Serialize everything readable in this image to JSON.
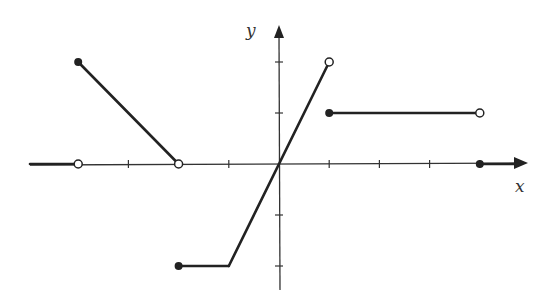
{
  "chart_data": {
    "type": "line",
    "title": "",
    "xlabel": "x",
    "ylabel": "y",
    "xlim": [
      -5,
      5
    ],
    "ylim": [
      -2,
      2
    ],
    "grid": false,
    "tick_labels_shown": false,
    "x_ticks": [
      -4,
      -3,
      -2,
      -1,
      1,
      2,
      3,
      4
    ],
    "y_ticks": [
      -2,
      -1,
      1,
      2
    ],
    "segments": [
      {
        "name": "left-ray",
        "from": [
          -5,
          0
        ],
        "to": [
          -4,
          0
        ],
        "start": "ray",
        "end": "open"
      },
      {
        "name": "decreasing-segment",
        "from": [
          -4,
          2
        ],
        "to": [
          -2,
          0
        ],
        "start": "closed",
        "end": "open"
      },
      {
        "name": "bottom-flat",
        "from": [
          -2,
          -2
        ],
        "to": [
          -1,
          -2
        ],
        "start": "closed",
        "end": "none"
      },
      {
        "name": "rising-segment",
        "from": [
          -1,
          -2
        ],
        "to": [
          1,
          2
        ],
        "start": "none",
        "end": "open"
      },
      {
        "name": "upper-flat",
        "from": [
          1,
          1
        ],
        "to": [
          4,
          1
        ],
        "start": "closed",
        "end": "open"
      },
      {
        "name": "right-ray",
        "from": [
          4,
          0
        ],
        "to": [
          5,
          0
        ],
        "start": "closed",
        "end": "arrow"
      }
    ],
    "piecewise": [
      {
        "domain": "x < -4",
        "rule": "y = 0"
      },
      {
        "domain": "-4 <= x < -2",
        "rule": "y = -x - 2"
      },
      {
        "domain": "-2 <= x <= -1",
        "rule": "y = -2"
      },
      {
        "domain": "-1 <= x < 1",
        "rule": "y = 2x"
      },
      {
        "domain": "1 <= x < 4",
        "rule": "y = 1"
      },
      {
        "domain": "x >= 4",
        "rule": "y = 0"
      }
    ]
  },
  "labels": {
    "x_axis": "x",
    "y_axis": "y"
  },
  "colors": {
    "ink": "#222222",
    "axis": "#333333",
    "background": "#ffffff"
  },
  "layout": {
    "origin_px": [
      279,
      164
    ],
    "unit_x_px": 50.2,
    "unit_y_px": 51
  }
}
